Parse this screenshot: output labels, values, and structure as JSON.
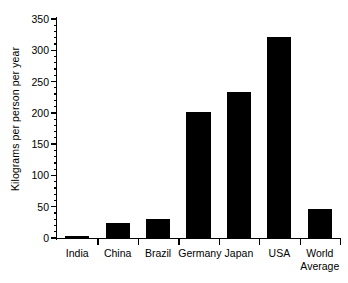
{
  "chart_data": {
    "type": "bar",
    "title": "",
    "subtitle": "",
    "xlabel": "",
    "ylabel": "Kilograms per person per year",
    "categories": [
      "India",
      "China",
      "Brazil",
      "Germany",
      "Japan",
      "USA",
      "World\nAverage"
    ],
    "values": [
      4,
      24,
      31,
      201,
      233,
      321,
      47
    ],
    "ylim": [
      0,
      350
    ],
    "ytick_labels": [
      "0",
      "50",
      "100",
      "150",
      "200",
      "250",
      "300",
      "350"
    ],
    "ytick_values": [
      0,
      50,
      100,
      150,
      200,
      250,
      300,
      350
    ],
    "yminor_interval": 10,
    "grid": false,
    "legend": null,
    "legend_position": "none",
    "bar_color": "#000000",
    "background_color": "#ffffff",
    "axis_color": "#000000",
    "annotations": []
  }
}
